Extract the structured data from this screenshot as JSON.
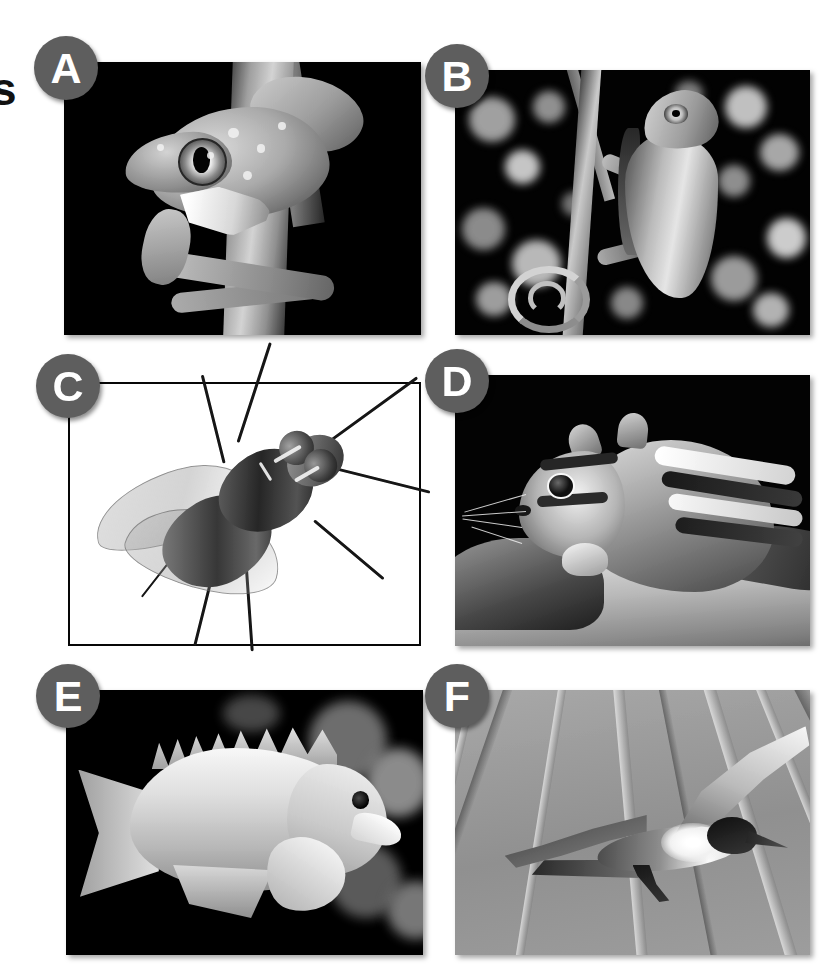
{
  "figure": {
    "background_color": "#ffffff",
    "layout": "3-rows-by-2-columns",
    "margin_glyph": "s",
    "badge": {
      "fill_color": "#5e5e5e",
      "text_color": "#ffffff",
      "shape": "circle"
    }
  },
  "panels": [
    {
      "id": "A",
      "label": "A",
      "subject": "tree-frog",
      "subject_label": "Tree frog clinging to a branch",
      "group": "Amphibia",
      "background_color": "#050505",
      "framed": false,
      "row": 1,
      "column": 1
    },
    {
      "id": "B",
      "label": "B",
      "subject": "chameleon",
      "subject_label": "Chameleon with coiled tail on a twig",
      "group": "Reptilia",
      "background_color": "#080808",
      "framed": false,
      "row": 1,
      "column": 2
    },
    {
      "id": "C",
      "label": "C",
      "subject": "housefly",
      "subject_label": "Housefly on a white background",
      "group": "Insecta",
      "background_color": "#ffffff",
      "framed": true,
      "row": 2,
      "column": 1
    },
    {
      "id": "D",
      "label": "D",
      "subject": "chipmunk",
      "subject_label": "Chipmunk perched on a rock",
      "group": "Mammalia",
      "background_color": "#090909",
      "framed": false,
      "row": 2,
      "column": 2
    },
    {
      "id": "E",
      "label": "E",
      "subject": "damselfish",
      "subject_label": "Damselfish swimming past dark coral",
      "group": "Actinopterygii",
      "background_color": "#060606",
      "framed": false,
      "row": 3,
      "column": 1
    },
    {
      "id": "F",
      "label": "F",
      "subject": "tern",
      "subject_label": "Tern in flight against a gray sky",
      "group": "Aves",
      "background_color": "#9a9a9a",
      "framed": false,
      "row": 3,
      "column": 2
    }
  ]
}
